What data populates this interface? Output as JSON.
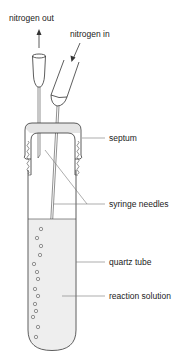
{
  "diagram": {
    "type": "labeled-apparatus",
    "labels": {
      "nitrogen_out": "nitrogen out",
      "nitrogen_in": "nitrogen in",
      "septum": "septum",
      "syringe_needles": "syringe needles",
      "quartz_tube": "quartz tube",
      "reaction_solution": "reaction solution"
    },
    "colors": {
      "line": "#333333",
      "leader": "#777777",
      "solution_fill": "#eeeeee",
      "septum_fill": "#e4e4e4",
      "background": "#ffffff"
    }
  }
}
